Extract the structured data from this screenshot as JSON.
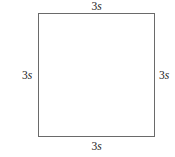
{
  "figure": {
    "type": "geometry-diagram",
    "shape": "square",
    "background_color": "#ffffff",
    "stroke_color": "#6a6a6a",
    "text_color": "#1a1a1a"
  },
  "labels": {
    "top": {
      "coefficient": "3",
      "variable": "s",
      "full": "3s"
    },
    "right": {
      "coefficient": "3",
      "variable": "s",
      "full": "3s"
    },
    "bottom": {
      "coefficient": "3",
      "variable": "s",
      "full": "3s"
    },
    "left": {
      "coefficient": "3",
      "variable": "s",
      "full": "3s"
    }
  }
}
